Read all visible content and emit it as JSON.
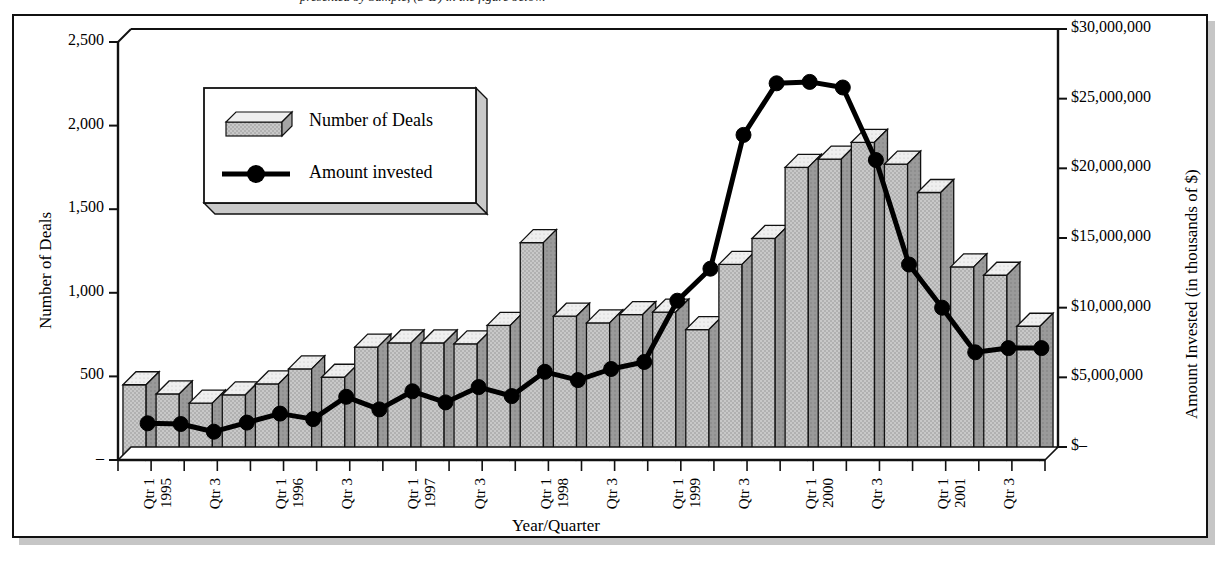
{
  "caption": {
    "text": "presented by Sample, (3-D) in the figure below."
  },
  "chart_data": {
    "type": "bar",
    "title": "",
    "subtitle": "",
    "xlabel": "Year/Quarter",
    "ylabel": "Number of Deals",
    "y2label": "Amount Invested (in thousands of $)",
    "grid": false,
    "legend_position": "upper-left-inside",
    "ylim": [
      0,
      2500
    ],
    "y2lim": [
      0,
      30000000
    ],
    "ytick_labels": [
      "2,500",
      "2,000",
      "1,500",
      "1,000",
      "500",
      "–"
    ],
    "ytick_values": [
      2500,
      2000,
      1500,
      1000,
      500,
      0
    ],
    "y2tick_labels": [
      "$30,000,000",
      "$25,000,000",
      "$20,000,000",
      "$15,000,000",
      "$10,000,000",
      "$5,000,000",
      "$–"
    ],
    "y2tick_values": [
      30000000,
      25000000,
      20000000,
      15000000,
      10000000,
      5000000,
      0
    ],
    "categories": [
      "Qtr 1",
      "Qtr 2",
      "Qtr 3",
      "Qtr 4",
      "Qtr 1",
      "Qtr 2",
      "Qtr 3",
      "Qtr 4",
      "Qtr 1",
      "Qtr 2",
      "Qtr 3",
      "Qtr 4",
      "Qtr 1",
      "Qtr 2",
      "Qtr 3",
      "Qtr 4",
      "Qtr 1",
      "Qtr 2",
      "Qtr 3",
      "Qtr 4",
      "Qtr 1",
      "Qtr 2",
      "Qtr 3",
      "Qtr 4",
      "Qtr 1",
      "Qtr 2",
      "Qtr 3",
      "Qtr 4"
    ],
    "category_years": [
      "1995",
      "",
      "",
      "",
      "1996",
      "",
      "",
      "",
      "1997",
      "",
      "",
      "",
      "1998",
      "",
      "",
      "",
      "1999",
      "",
      "",
      "",
      "2000",
      "",
      "",
      "",
      "2001",
      "",
      "",
      ""
    ],
    "xtick_visible": [
      true,
      false,
      true,
      false,
      true,
      false,
      true,
      false,
      true,
      false,
      true,
      false,
      true,
      false,
      true,
      false,
      true,
      false,
      true,
      false,
      true,
      false,
      true,
      false,
      true,
      false,
      true,
      false
    ],
    "series": [
      {
        "name": "Number of Deals",
        "kind": "bar",
        "axis": "left",
        "values": [
          450,
          395,
          340,
          390,
          455,
          545,
          495,
          675,
          700,
          700,
          695,
          805,
          1300,
          860,
          820,
          870,
          885,
          780,
          1170,
          1325,
          1750,
          1800,
          1900,
          1770,
          1600,
          1155,
          1105,
          800
        ]
      },
      {
        "name": "Amount invested",
        "kind": "line",
        "axis": "right",
        "values": [
          1700000,
          1650000,
          1100000,
          1750000,
          2400000,
          2000000,
          3600000,
          2700000,
          4000000,
          3200000,
          4300000,
          3650000,
          5400000,
          4800000,
          5600000,
          6100000,
          10500000,
          12800000,
          22400000,
          26100000,
          26200000,
          25800000,
          20600000,
          13100000,
          10000000,
          6800000,
          7100000,
          7100000
        ]
      }
    ]
  },
  "legend": {
    "entries": [
      {
        "label": "Number of Deals",
        "swatch": "bar-3d-swatch"
      },
      {
        "label": "Amount invested",
        "swatch": "line-marker-swatch"
      }
    ]
  },
  "colors": {
    "bar_front": "#c8c8c8",
    "bar_top": "#efefef",
    "bar_side": "#9a9a9a",
    "line": "#000000",
    "frame": "#111111",
    "background": "#ffffff"
  }
}
